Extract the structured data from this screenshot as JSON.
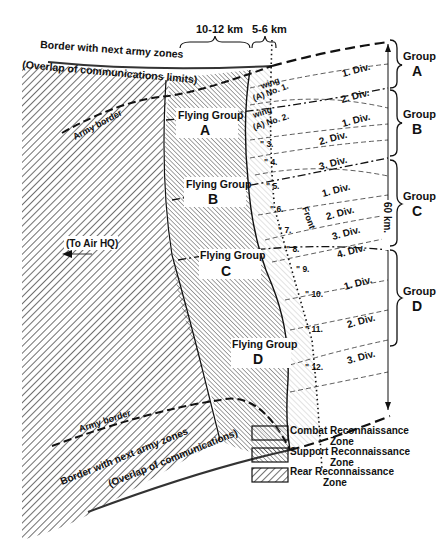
{
  "labels": {
    "border_top_1": "Border with next army zones",
    "border_top_2": "(Overlap of communications limits)",
    "army_border_top": "Army border",
    "army_border_bottom": "Army border",
    "border_bottom_1": "Border with next army zones",
    "border_bottom_2": "(Overlap of communications)",
    "to_air_hq": "(To Air HQ)",
    "width_support": "10-12 km",
    "width_combat": "5-6 km",
    "front": "Front",
    "depth": "60 km."
  },
  "flying_groups": [
    {
      "title": "Flying Group",
      "letter": "A"
    },
    {
      "title": "Flying Group",
      "letter": "B"
    },
    {
      "title": "Flying Group",
      "letter": "C"
    },
    {
      "title": "Flying Group",
      "letter": "D"
    }
  ],
  "wings": [
    "wing",
    "(A) No. 1.",
    "wing",
    "(A) No. 2.",
    "\" 3.",
    "\" 4.",
    "\" 5.",
    "\" 6.",
    "\" 7.",
    "\" 8.",
    "\" 9.",
    "\" 10.",
    "\" 11.",
    "\" 12."
  ],
  "divisions": [
    "1. Div.",
    "2. Div.",
    "1. Div.",
    "2. Div.",
    "3. Div.",
    "1. Div.",
    "2. Div.",
    "3. Div.",
    "4. Div.",
    "1. Div.",
    "2. Div.",
    "3. Div."
  ],
  "groups": [
    {
      "title": "Group",
      "letter": "A"
    },
    {
      "title": "Group",
      "letter": "B"
    },
    {
      "title": "Group",
      "letter": "C"
    },
    {
      "title": "Group",
      "letter": "D"
    }
  ],
  "legend": [
    {
      "line1": "Combat Reconnaissance",
      "line2": "Zone"
    },
    {
      "line1": "Support Reconnaissance",
      "line2": "Zone"
    },
    {
      "line1": "Rear Reconnaissance",
      "line2": "Zone"
    }
  ]
}
